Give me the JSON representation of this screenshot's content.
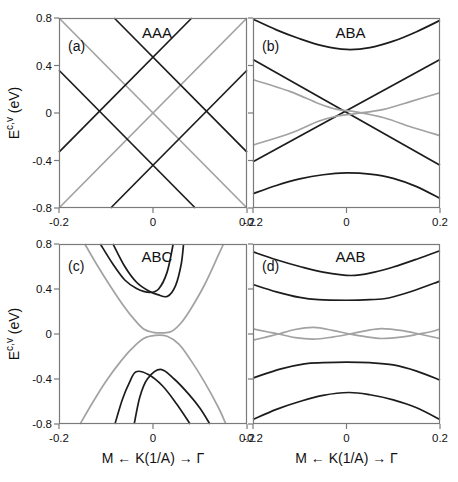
{
  "colors": {
    "band_black": "#1c1c1c",
    "band_gray": "#a2a2a2",
    "frame": "#7a7a7a",
    "text": "#111111",
    "background": "#ffffff"
  },
  "axis": {
    "x_title": "M ← K(1/A) → Γ",
    "y_title_base": "E",
    "y_title_sup": "c,v",
    "y_title_unit": " (eV)"
  },
  "chart_data": [
    {
      "id": "a",
      "panel_label": "(a)",
      "stacking": "AAA",
      "type": "line",
      "x_range": [
        -0.2,
        0.2
      ],
      "y_range": [
        -0.8,
        0.8
      ],
      "x_tick_values": [
        -0.2,
        0,
        0.2
      ],
      "x_tick_labels": [
        "-0.2",
        "0",
        "0.2"
      ],
      "y_tick_values": [
        0.8,
        0.4,
        0,
        -0.4,
        -0.8
      ],
      "y_tick_labels": [
        "0.8",
        "0.4",
        "0",
        "-0.4",
        "-0.8"
      ],
      "show_y_tick_labels": true,
      "show_x_axis_title": false,
      "series": [
        {
          "name": "gray-linear-band-1",
          "color": "gray",
          "points": [
            [
              -0.2,
              0.8
            ],
            [
              0.2,
              -0.8
            ]
          ]
        },
        {
          "name": "gray-linear-band-2",
          "color": "gray",
          "points": [
            [
              -0.2,
              -0.8
            ],
            [
              0.2,
              0.8
            ]
          ]
        },
        {
          "name": "black-linear-band-1",
          "color": "black",
          "points": [
            [
              -0.0825,
              0.8
            ],
            [
              0.2,
              -0.33
            ]
          ]
        },
        {
          "name": "black-linear-band-2",
          "color": "black",
          "points": [
            [
              -0.2,
              -0.33
            ],
            [
              0.0825,
              0.8
            ]
          ]
        },
        {
          "name": "black-linear-band-3",
          "color": "black",
          "points": [
            [
              -0.2,
              0.36
            ],
            [
              0.09,
              -0.8
            ]
          ]
        },
        {
          "name": "black-linear-band-4",
          "color": "black",
          "points": [
            [
              -0.09,
              -0.8
            ],
            [
              0.2,
              0.36
            ]
          ]
        }
      ]
    },
    {
      "id": "b",
      "panel_label": "(b)",
      "stacking": "ABA",
      "type": "line",
      "x_range": [
        -0.2,
        0.2
      ],
      "y_range": [
        -0.8,
        0.8
      ],
      "x_tick_values": [
        -0.2,
        0,
        0.2
      ],
      "x_tick_labels": [
        "-0.2",
        "0",
        "0.2"
      ],
      "y_tick_values": [
        0.8,
        0.4,
        0,
        -0.4,
        -0.8
      ],
      "y_tick_labels": [
        "0.8",
        "0.4",
        "0",
        "-0.4",
        "-0.8"
      ],
      "show_y_tick_labels": false,
      "show_x_axis_title": false,
      "series": [
        {
          "name": "black-upper-hyperbola",
          "color": "black",
          "points": [
            [
              -0.2,
              0.79
            ],
            [
              -0.15,
              0.7
            ],
            [
              -0.1,
              0.625
            ],
            [
              -0.05,
              0.565
            ],
            [
              0,
              0.535
            ],
            [
              0.05,
              0.55
            ],
            [
              0.1,
              0.605
            ],
            [
              0.15,
              0.685
            ],
            [
              0.2,
              0.78
            ]
          ]
        },
        {
          "name": "black-linear-descending",
          "color": "black",
          "points": [
            [
              -0.2,
              0.45
            ],
            [
              0.2,
              -0.44
            ]
          ]
        },
        {
          "name": "black-linear-ascending",
          "color": "black",
          "points": [
            [
              -0.2,
              -0.41
            ],
            [
              0.2,
              0.45
            ]
          ]
        },
        {
          "name": "gray-band-descending",
          "color": "gray",
          "points": [
            [
              -0.2,
              0.28
            ],
            [
              -0.12,
              0.18
            ],
            [
              -0.06,
              0.08
            ],
            [
              -0.02,
              0.03
            ],
            [
              0.02,
              0.01
            ],
            [
              0.08,
              -0.04
            ],
            [
              0.14,
              -0.12
            ],
            [
              0.2,
              -0.19
            ]
          ]
        },
        {
          "name": "gray-band-ascending",
          "color": "gray",
          "points": [
            [
              -0.2,
              -0.27
            ],
            [
              -0.12,
              -0.17
            ],
            [
              -0.06,
              -0.07
            ],
            [
              -0.02,
              -0.025
            ],
            [
              0.02,
              -0.005
            ],
            [
              0.08,
              0.03
            ],
            [
              0.14,
              0.1
            ],
            [
              0.2,
              0.17
            ]
          ]
        },
        {
          "name": "black-lower-hyperbola",
          "color": "black",
          "points": [
            [
              -0.2,
              -0.68
            ],
            [
              -0.15,
              -0.61
            ],
            [
              -0.1,
              -0.555
            ],
            [
              -0.05,
              -0.52
            ],
            [
              0,
              -0.505
            ],
            [
              0.05,
              -0.515
            ],
            [
              0.1,
              -0.55
            ],
            [
              0.15,
              -0.62
            ],
            [
              0.2,
              -0.72
            ]
          ]
        }
      ]
    },
    {
      "id": "c",
      "panel_label": "(c)",
      "stacking": "ABC",
      "type": "line",
      "x_range": [
        -0.2,
        0.2
      ],
      "y_range": [
        -0.8,
        0.8
      ],
      "x_tick_values": [
        -0.2,
        0,
        0.2
      ],
      "x_tick_labels": [
        "-0.2",
        "0",
        "0.2"
      ],
      "y_tick_values": [
        0.8,
        0.4,
        0,
        -0.4,
        -0.8
      ],
      "y_tick_labels": [
        "0.8",
        "0.4",
        "0",
        "-0.4",
        "-0.8"
      ],
      "show_y_tick_labels": true,
      "show_x_axis_title": true,
      "series": [
        {
          "name": "gray-conduction-cone",
          "color": "gray",
          "points": [
            [
              -0.145,
              0.8
            ],
            [
              -0.12,
              0.62
            ],
            [
              -0.09,
              0.42
            ],
            [
              -0.06,
              0.235
            ],
            [
              -0.04,
              0.13
            ],
            [
              -0.02,
              0.045
            ],
            [
              0,
              0.015
            ],
            [
              0.02,
              0.01
            ],
            [
              0.04,
              0.025
            ],
            [
              0.06,
              0.1
            ],
            [
              0.08,
              0.22
            ],
            [
              0.11,
              0.44
            ],
            [
              0.14,
              0.71
            ],
            [
              0.15,
              0.8
            ]
          ]
        },
        {
          "name": "gray-valence-cone",
          "color": "gray",
          "points": [
            [
              -0.155,
              -0.8
            ],
            [
              -0.13,
              -0.62
            ],
            [
              -0.1,
              -0.42
            ],
            [
              -0.07,
              -0.25
            ],
            [
              -0.045,
              -0.13
            ],
            [
              -0.02,
              -0.04
            ],
            [
              0.005,
              -0.012
            ],
            [
              0.03,
              -0.02
            ],
            [
              0.055,
              -0.09
            ],
            [
              0.08,
              -0.23
            ],
            [
              0.11,
              -0.43
            ],
            [
              0.14,
              -0.66
            ],
            [
              0.155,
              -0.8
            ]
          ]
        },
        {
          "name": "black-conduction-band-1",
          "color": "black",
          "points": [
            [
              -0.112,
              0.8
            ],
            [
              -0.085,
              0.62
            ],
            [
              -0.06,
              0.48
            ],
            [
              -0.035,
              0.405
            ],
            [
              -0.007,
              0.37
            ],
            [
              0.012,
              0.4
            ],
            [
              0.03,
              0.55
            ],
            [
              0.043,
              0.8
            ]
          ]
        },
        {
          "name": "black-conduction-band-2",
          "color": "black",
          "points": [
            [
              -0.085,
              0.8
            ],
            [
              -0.06,
              0.6
            ],
            [
              -0.035,
              0.46
            ],
            [
              -0.01,
              0.385
            ],
            [
              0.01,
              0.35
            ],
            [
              0.031,
              0.335
            ],
            [
              0.048,
              0.43
            ],
            [
              0.06,
              0.62
            ],
            [
              0.065,
              0.8
            ]
          ]
        },
        {
          "name": "black-valence-band-1",
          "color": "black",
          "points": [
            [
              -0.081,
              -0.8
            ],
            [
              -0.065,
              -0.58
            ],
            [
              -0.05,
              -0.43
            ],
            [
              -0.036,
              -0.335
            ],
            [
              -0.01,
              -0.36
            ],
            [
              0.02,
              -0.46
            ],
            [
              0.05,
              -0.62
            ],
            [
              0.079,
              -0.8
            ]
          ]
        },
        {
          "name": "black-valence-band-2",
          "color": "black",
          "points": [
            [
              -0.04,
              -0.8
            ],
            [
              -0.028,
              -0.56
            ],
            [
              -0.012,
              -0.4
            ],
            [
              0.016,
              -0.315
            ],
            [
              0.045,
              -0.4
            ],
            [
              0.075,
              -0.53
            ],
            [
              0.1,
              -0.66
            ],
            [
              0.121,
              -0.8
            ]
          ]
        }
      ]
    },
    {
      "id": "d",
      "panel_label": "(d)",
      "stacking": "AAB",
      "type": "line",
      "x_range": [
        -0.2,
        0.2
      ],
      "y_range": [
        -0.8,
        0.8
      ],
      "x_tick_values": [
        -0.2,
        0,
        0.2
      ],
      "x_tick_labels": [
        "-0.2",
        "0",
        "0.2"
      ],
      "y_tick_values": [
        0.8,
        0.4,
        0,
        -0.4,
        -0.8
      ],
      "y_tick_labels": [
        "0.8",
        "0.4",
        "0",
        "-0.4",
        "-0.8"
      ],
      "show_y_tick_labels": false,
      "show_x_axis_title": true,
      "series": [
        {
          "name": "black-conduction-band-upper",
          "color": "black",
          "points": [
            [
              -0.2,
              0.73
            ],
            [
              -0.15,
              0.66
            ],
            [
              -0.1,
              0.6
            ],
            [
              -0.05,
              0.55
            ],
            [
              0.01,
              0.52
            ],
            [
              0.06,
              0.55
            ],
            [
              0.1,
              0.595
            ],
            [
              0.15,
              0.665
            ],
            [
              0.2,
              0.74
            ]
          ]
        },
        {
          "name": "black-conduction-band-lower",
          "color": "black",
          "points": [
            [
              -0.2,
              0.44
            ],
            [
              -0.15,
              0.375
            ],
            [
              -0.1,
              0.325
            ],
            [
              -0.06,
              0.305
            ],
            [
              0,
              0.3
            ],
            [
              0.05,
              0.305
            ],
            [
              0.09,
              0.32
            ],
            [
              0.14,
              0.38
            ],
            [
              0.2,
              0.47
            ]
          ]
        },
        {
          "name": "gray-oscillating-band-1",
          "color": "gray",
          "points": [
            [
              -0.2,
              0.045
            ],
            [
              -0.17,
              0.02
            ],
            [
              -0.145,
              0
            ],
            [
              -0.11,
              -0.032
            ],
            [
              -0.07,
              -0.045
            ],
            [
              -0.03,
              -0.027
            ],
            [
              0.005,
              -0.002
            ],
            [
              0.04,
              0.028
            ],
            [
              0.075,
              0.048
            ],
            [
              0.12,
              0.03
            ],
            [
              0.155,
              0
            ],
            [
              0.18,
              -0.022
            ],
            [
              0.2,
              -0.04
            ]
          ]
        },
        {
          "name": "gray-oscillating-band-2",
          "color": "gray",
          "points": [
            [
              -0.2,
              -0.055
            ],
            [
              -0.17,
              -0.025
            ],
            [
              -0.145,
              0
            ],
            [
              -0.11,
              0.04
            ],
            [
              -0.07,
              0.058
            ],
            [
              -0.03,
              0.033
            ],
            [
              0.005,
              0.002
            ],
            [
              0.04,
              -0.024
            ],
            [
              0.075,
              -0.04
            ],
            [
              0.12,
              -0.026
            ],
            [
              0.155,
              0
            ],
            [
              0.18,
              0.02
            ],
            [
              0.2,
              0.045
            ]
          ]
        },
        {
          "name": "black-valence-band-upper",
          "color": "black",
          "points": [
            [
              -0.2,
              -0.39
            ],
            [
              -0.14,
              -0.31
            ],
            [
              -0.09,
              -0.265
            ],
            [
              -0.05,
              -0.255
            ],
            [
              0,
              -0.25
            ],
            [
              0.05,
              -0.255
            ],
            [
              0.1,
              -0.275
            ],
            [
              0.15,
              -0.33
            ],
            [
              0.2,
              -0.41
            ]
          ]
        },
        {
          "name": "black-valence-band-lower",
          "color": "black",
          "points": [
            [
              -0.2,
              -0.76
            ],
            [
              -0.15,
              -0.67
            ],
            [
              -0.1,
              -0.6
            ],
            [
              -0.05,
              -0.545
            ],
            [
              0.005,
              -0.52
            ],
            [
              0.05,
              -0.54
            ],
            [
              0.1,
              -0.585
            ],
            [
              0.15,
              -0.655
            ],
            [
              0.2,
              -0.76
            ]
          ]
        }
      ]
    }
  ]
}
